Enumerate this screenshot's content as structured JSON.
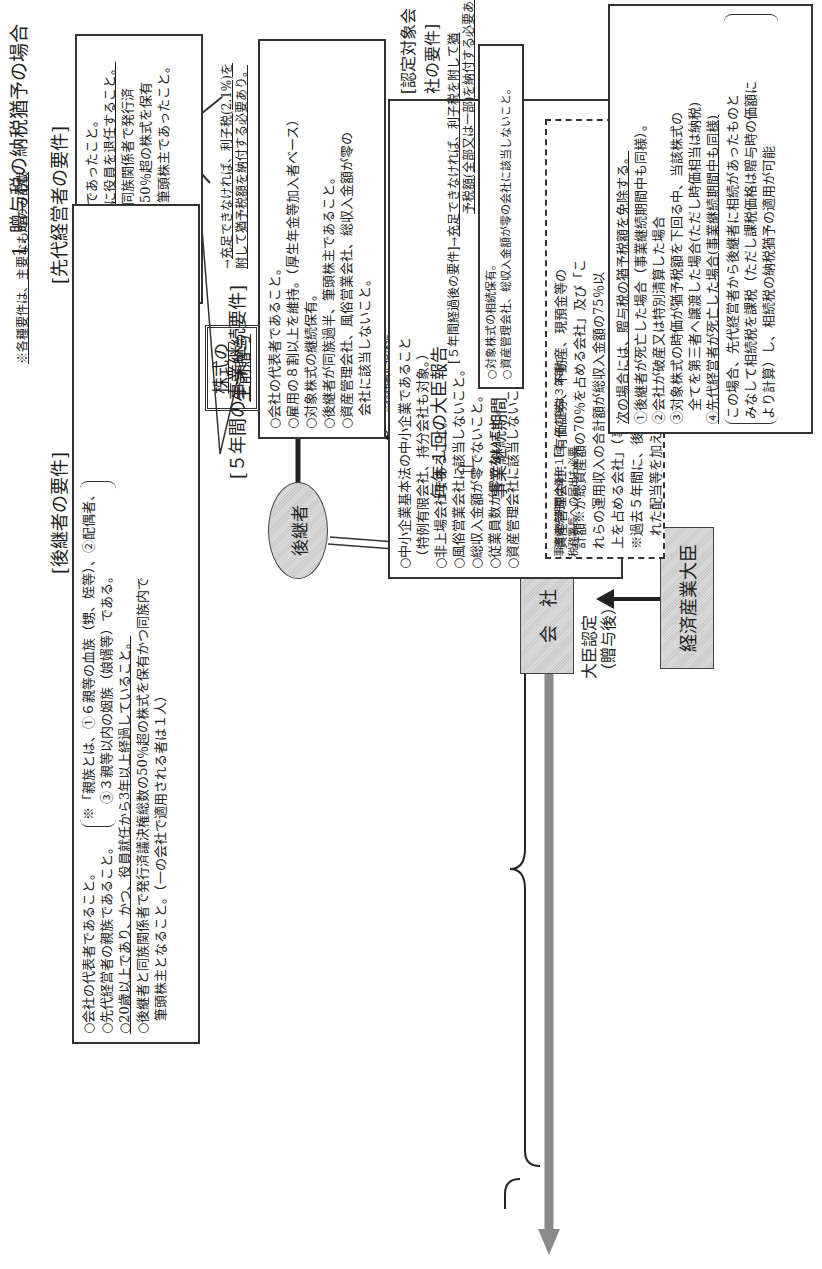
{
  "title": "1. 贈与税の納税猶予の場合",
  "note": "※各種要件は、主要なもののみ記載",
  "predecessor": {
    "heading": "[先代経営者の要件]",
    "items": [
      "○会社の代表者であったこと。",
      "○贈与の時までに役員を退任すること。",
      "○先代経営者と同族関係者で発行済",
      "　議決権総数の50％超の株式を保有",
      "　かつ同族内で筆頭株主であったこと。"
    ],
    "node": "先代経営者"
  },
  "successor": {
    "heading": "[後継者の要件]",
    "items": [
      "○会社の代表者であること。",
      "○先代経営者の親族であること。",
      "○20歳以上であり、かつ、役員就任から3年以上経過していること。",
      "○後継者と同族関係者で発行済議決権総数の50％超の株式を保有かつ同族内で",
      "　筆頭株主となること。（一の会社で適用される者は１人）"
    ],
    "kinship_note_1": "※「親族とは、①６親等の血族（甥、姪等）、②配偶者、",
    "kinship_note_2": "③３親等以内の姻族（娘婿等）である。",
    "node": "後継者"
  },
  "gift": {
    "label_line1": "株式の",
    "label_line2": "生前贈与",
    "deferral": "納税猶予",
    "collateral_note_1": "※税務署に担保提",
    "collateral_note_2": "供の必要あり。"
  },
  "company": {
    "node": "会　社",
    "certification": "大臣認定",
    "certification_sub": "（贈与後）",
    "minister": "経済産業大臣"
  },
  "company_requirements": {
    "heading": "[認定対象会社の要件]",
    "items": [
      "○中小企業基本法の中小企業であること",
      "　（特例有限会社、持分会社も対象。）",
      "○非上場会社であること。",
      "○風俗営業会社に該当しないこと。",
      "○総収入金額が零でないこと。",
      "○従業員数が零でないこと。",
      "○資産管理会社に該当しないこと。"
    ],
    "asset_mgmt_note": [
      "資産管理会社：「有価証券、不動産、現預金等の",
      "計額※が総資産額の70％を占める会社」及び「こ",
      "れらの運用収入の合計額が総収入金額の75％以",
      "上を占める会社」（事業実態のある会社は除く。）",
      "※過去５年間に、後継者と同族関係者に支払わ",
      "　れた配当等を加える。"
    ]
  },
  "five_year": {
    "heading": "[５年間の事業継続要件]",
    "consequence_1": "充足できなければ、利子税(2.1%)を",
    "consequence_2": "附して猶予税額を納付する必要あり。",
    "items": [
      "○会社の代表者であること。",
      "○雇用の８割以上を維持。（厚生年金等加入者ベース）",
      "○対象株式の継続保有。",
      "○後継者が同族過半、筆頭株主であること。",
      "○資産管理会社、風俗営業会社、総収入金額が零の",
      "　会社に該当しないこと。"
    ],
    "annual_report": "毎年１回の大臣報告",
    "period_label": "事業継続期間（５年間）"
  },
  "after_five": {
    "heading": "[５年間経過後の要件]",
    "consequence_1": "充足できなければ、利子税を附して猶",
    "consequence_2": "予税額(全部又は一部)を納付する必要あり。",
    "items": [
      "○対象株式の相続保有。",
      "○資産管理会社、総収入金額が零の会社に該当しないこと。"
    ]
  },
  "timeline_note": {
    "line1": "事業継続期間は毎年１回、その後は３年毎に",
    "line2": "税務署長への届出も必要"
  },
  "exemption": {
    "intro": "次の場合には、贈与税の猶予税額を免除する。",
    "items": [
      "①後継者が死亡した場合（事業継続期間中も同様）。",
      "②会社が破産又は特別清算した場合",
      "③対象株式の時価が猶予税額を下回る中、当該株式の",
      "　全てを第三者へ譲渡した場合(ただし時価相当は納税)",
      "④先代経営者が死亡した場合(事業継続期間中も同様)"
    ],
    "sub": [
      "この場合、先代経営者から後継者に相続があったものと",
      "みなして相続税を課税（ただし課税価格は贈与時の価額に",
      "より計算）し、相続税の納税猶予の適用が可能"
    ]
  }
}
